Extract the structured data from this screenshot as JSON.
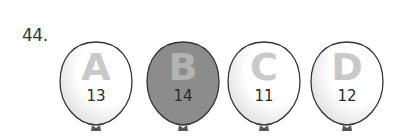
{
  "question": {
    "number": "44."
  },
  "balloons": [
    {
      "letter": "A",
      "number": "13",
      "fill": "#ffffff",
      "shaded": false
    },
    {
      "letter": "B",
      "number": "14",
      "fill": "#8a8a8a",
      "shaded": true
    },
    {
      "letter": "C",
      "number": "11",
      "fill": "#ffffff",
      "shaded": false
    },
    {
      "letter": "D",
      "number": "12",
      "fill": "#ffffff",
      "shaded": false
    }
  ]
}
